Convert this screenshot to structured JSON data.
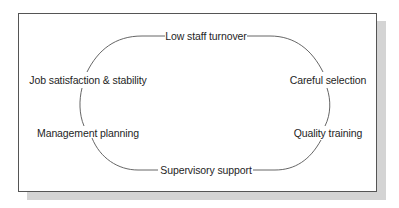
{
  "diagram": {
    "type": "cycle",
    "nodes": [
      {
        "id": "top",
        "label": "Low staff turnover"
      },
      {
        "id": "right-upper",
        "label": "Careful selection"
      },
      {
        "id": "right-lower",
        "label": "Quality training"
      },
      {
        "id": "bottom",
        "label": "Supervisory support"
      },
      {
        "id": "left-lower",
        "label": "Management planning"
      },
      {
        "id": "left-upper",
        "label": "Job satisfaction & stability"
      }
    ],
    "line_color": "#555555",
    "frame_border_color": "#555555",
    "shadow_color": "#d4d4d4"
  }
}
